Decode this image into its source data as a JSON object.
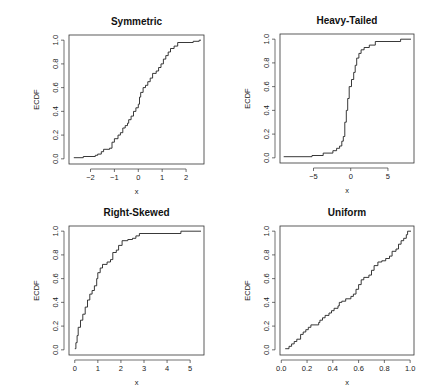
{
  "chart_data": [
    {
      "type": "line",
      "subtype": "step-ecdf",
      "title": "Symmetric",
      "xlabel": "x",
      "ylabel": "ECDF",
      "xlim": [
        -2.9,
        2.75
      ],
      "ylim": [
        0,
        1
      ],
      "xticks": [
        -2,
        -1,
        0,
        1,
        2
      ],
      "xtick_labels": [
        "-2",
        "-1",
        "0",
        "1",
        "2"
      ],
      "yticks": [
        0.0,
        0.2,
        0.4,
        0.6,
        0.8,
        1.0
      ],
      "ytick_labels": [
        "0.0",
        "0.2",
        "0.4",
        "0.6",
        "0.8",
        "1.0"
      ],
      "points": [
        [
          -2.7,
          0.01
        ],
        [
          -2.3,
          0.02
        ],
        [
          -1.8,
          0.03
        ],
        [
          -1.7,
          0.04
        ],
        [
          -1.55,
          0.06
        ],
        [
          -1.45,
          0.08
        ],
        [
          -1.2,
          0.09
        ],
        [
          -1.1,
          0.14
        ],
        [
          -1.0,
          0.17
        ],
        [
          -0.85,
          0.2
        ],
        [
          -0.75,
          0.22
        ],
        [
          -0.65,
          0.26
        ],
        [
          -0.55,
          0.28
        ],
        [
          -0.45,
          0.3
        ],
        [
          -0.4,
          0.33
        ],
        [
          -0.3,
          0.36
        ],
        [
          -0.2,
          0.4
        ],
        [
          -0.1,
          0.43
        ],
        [
          0.0,
          0.46
        ],
        [
          0.05,
          0.52
        ],
        [
          0.1,
          0.56
        ],
        [
          0.2,
          0.6
        ],
        [
          0.3,
          0.62
        ],
        [
          0.4,
          0.65
        ],
        [
          0.5,
          0.68
        ],
        [
          0.6,
          0.72
        ],
        [
          0.75,
          0.74
        ],
        [
          0.85,
          0.77
        ],
        [
          0.95,
          0.8
        ],
        [
          1.05,
          0.84
        ],
        [
          1.15,
          0.87
        ],
        [
          1.25,
          0.9
        ],
        [
          1.35,
          0.93
        ],
        [
          1.5,
          0.95
        ],
        [
          1.65,
          0.98
        ],
        [
          2.3,
          0.99
        ],
        [
          2.55,
          1.0
        ]
      ]
    },
    {
      "type": "line",
      "subtype": "step-ecdf",
      "title": "Heavy-Tailed",
      "xlabel": "x",
      "ylabel": "ECDF",
      "xlim": [
        -9.5,
        8.5
      ],
      "ylim": [
        0,
        1
      ],
      "xticks": [
        -5,
        0,
        5
      ],
      "xtick_labels": [
        "-5",
        "0",
        "5"
      ],
      "yticks": [
        0.0,
        0.2,
        0.4,
        0.6,
        0.8,
        1.0
      ],
      "ytick_labels": [
        "0.0",
        "0.2",
        "0.4",
        "0.6",
        "0.8",
        "1.0"
      ],
      "points": [
        [
          -9.0,
          0.01
        ],
        [
          -5.2,
          0.02
        ],
        [
          -3.7,
          0.04
        ],
        [
          -2.4,
          0.06
        ],
        [
          -1.9,
          0.08
        ],
        [
          -1.5,
          0.1
        ],
        [
          -1.2,
          0.14
        ],
        [
          -1.0,
          0.18
        ],
        [
          -0.8,
          0.3
        ],
        [
          -0.6,
          0.4
        ],
        [
          -0.4,
          0.5
        ],
        [
          -0.2,
          0.6
        ],
        [
          0.1,
          0.66
        ],
        [
          0.4,
          0.72
        ],
        [
          0.6,
          0.78
        ],
        [
          0.8,
          0.84
        ],
        [
          1.1,
          0.88
        ],
        [
          1.4,
          0.91
        ],
        [
          1.8,
          0.93
        ],
        [
          2.5,
          0.95
        ],
        [
          3.3,
          0.98
        ],
        [
          6.7,
          1.0
        ]
      ]
    },
    {
      "type": "line",
      "subtype": "step-ecdf",
      "title": "Right-Skewed",
      "xlabel": "x",
      "ylabel": "ECDF",
      "xlim": [
        -0.25,
        5.6
      ],
      "ylim": [
        0,
        1
      ],
      "xticks": [
        0,
        1,
        2,
        3,
        4,
        5
      ],
      "xtick_labels": [
        "0",
        "1",
        "2",
        "3",
        "4",
        "5"
      ],
      "yticks": [
        0.0,
        0.2,
        0.4,
        0.6,
        0.8,
        1.0
      ],
      "ytick_labels": [
        "0.0",
        "0.2",
        "0.4",
        "0.6",
        "0.8",
        "1.0"
      ],
      "points": [
        [
          0.0,
          0.01
        ],
        [
          0.05,
          0.06
        ],
        [
          0.1,
          0.12
        ],
        [
          0.15,
          0.19
        ],
        [
          0.25,
          0.25
        ],
        [
          0.35,
          0.3
        ],
        [
          0.45,
          0.36
        ],
        [
          0.55,
          0.42
        ],
        [
          0.65,
          0.47
        ],
        [
          0.75,
          0.5
        ],
        [
          0.85,
          0.54
        ],
        [
          0.95,
          0.6
        ],
        [
          1.0,
          0.65
        ],
        [
          1.1,
          0.69
        ],
        [
          1.2,
          0.72
        ],
        [
          1.4,
          0.74
        ],
        [
          1.55,
          0.76
        ],
        [
          1.65,
          0.82
        ],
        [
          1.8,
          0.84
        ],
        [
          1.9,
          0.88
        ],
        [
          2.05,
          0.92
        ],
        [
          2.3,
          0.93
        ],
        [
          2.5,
          0.94
        ],
        [
          2.65,
          0.96
        ],
        [
          2.8,
          0.98
        ],
        [
          4.6,
          1.0
        ]
      ]
    },
    {
      "type": "line",
      "subtype": "step-ecdf",
      "title": "Uniform",
      "xlabel": "x",
      "ylabel": "ECDF",
      "xlim": [
        -0.01,
        1.03
      ],
      "ylim": [
        0,
        1
      ],
      "xticks": [
        0.0,
        0.2,
        0.4,
        0.6,
        0.8,
        1.0
      ],
      "xtick_labels": [
        "0.0",
        "0.2",
        "0.4",
        "0.6",
        "0.8",
        "1.0"
      ],
      "yticks": [
        0.0,
        0.2,
        0.4,
        0.6,
        0.8,
        1.0
      ],
      "ytick_labels": [
        "0.0",
        "0.2",
        "0.4",
        "0.6",
        "0.8",
        "1.0"
      ],
      "points": [
        [
          0.03,
          0.01
        ],
        [
          0.06,
          0.03
        ],
        [
          0.08,
          0.05
        ],
        [
          0.1,
          0.07
        ],
        [
          0.12,
          0.09
        ],
        [
          0.15,
          0.13
        ],
        [
          0.17,
          0.15
        ],
        [
          0.19,
          0.17
        ],
        [
          0.21,
          0.19
        ],
        [
          0.23,
          0.21
        ],
        [
          0.29,
          0.23
        ],
        [
          0.3,
          0.25
        ],
        [
          0.32,
          0.27
        ],
        [
          0.34,
          0.29
        ],
        [
          0.37,
          0.31
        ],
        [
          0.39,
          0.33
        ],
        [
          0.41,
          0.35
        ],
        [
          0.44,
          0.37
        ],
        [
          0.45,
          0.4
        ],
        [
          0.47,
          0.41
        ],
        [
          0.5,
          0.43
        ],
        [
          0.54,
          0.45
        ],
        [
          0.56,
          0.47
        ],
        [
          0.58,
          0.51
        ],
        [
          0.6,
          0.55
        ],
        [
          0.62,
          0.59
        ],
        [
          0.64,
          0.61
        ],
        [
          0.68,
          0.63
        ],
        [
          0.7,
          0.67
        ],
        [
          0.72,
          0.71
        ],
        [
          0.75,
          0.74
        ],
        [
          0.78,
          0.75
        ],
        [
          0.81,
          0.77
        ],
        [
          0.84,
          0.79
        ],
        [
          0.86,
          0.83
        ],
        [
          0.89,
          0.85
        ],
        [
          0.91,
          0.89
        ],
        [
          0.93,
          0.92
        ],
        [
          0.95,
          0.94
        ],
        [
          0.97,
          0.97
        ],
        [
          0.98,
          1.0
        ]
      ]
    }
  ],
  "panels": [
    {
      "box": [
        69,
        35,
        204,
        164
      ]
    },
    {
      "box": [
        280,
        34,
        414,
        163
      ]
    },
    {
      "box": [
        69,
        226,
        204,
        355
      ]
    },
    {
      "box": [
        280,
        226,
        414,
        355
      ]
    }
  ],
  "style": {
    "line_color": "#222222",
    "axis_color": "#333333",
    "background": "#ffffff"
  }
}
